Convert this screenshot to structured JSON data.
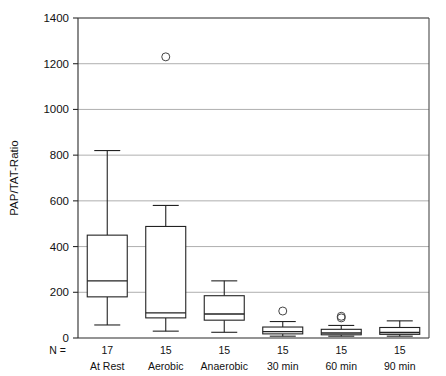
{
  "chart_data": {
    "type": "box",
    "title": "",
    "xlabel": "",
    "ylabel": "PAP/TAT-Ratio",
    "ylim": [
      0,
      1400
    ],
    "ytick_labels": [
      "0",
      "200",
      "400",
      "600",
      "800",
      "1000",
      "1200",
      "1400"
    ],
    "yticks": [
      0,
      200,
      400,
      600,
      800,
      1000,
      1200,
      1400
    ],
    "grid": "horizontal",
    "legend": "none",
    "n_row_prefix": "N =",
    "categories": [
      "At Rest",
      "Aerobic",
      "Anaerobic",
      "30 min",
      "60 min",
      "90 min"
    ],
    "counts": [
      "17",
      "15",
      "15",
      "15",
      "15",
      "15"
    ],
    "boxes": [
      {
        "category": "At Rest",
        "n": 17,
        "whisker_low": 57,
        "q1": 180,
        "median": 250,
        "q3": 450,
        "whisker_high": 820,
        "outliers": []
      },
      {
        "category": "Aerobic",
        "n": 15,
        "whisker_low": 30,
        "q1": 88,
        "median": 110,
        "q3": 488,
        "whisker_high": 580,
        "outliers": [
          1230
        ]
      },
      {
        "category": "Anaerobic",
        "n": 15,
        "whisker_low": 25,
        "q1": 78,
        "median": 105,
        "q3": 185,
        "whisker_high": 250,
        "outliers": []
      },
      {
        "category": "30 min",
        "n": 15,
        "whisker_low": 8,
        "q1": 18,
        "median": 28,
        "q3": 48,
        "whisker_high": 72,
        "outliers": [
          118
        ]
      },
      {
        "category": "60 min",
        "n": 15,
        "whisker_low": 8,
        "q1": 14,
        "median": 22,
        "q3": 38,
        "whisker_high": 55,
        "outliers": [
          95,
          88
        ]
      },
      {
        "category": "90 min",
        "n": 15,
        "whisker_low": 8,
        "q1": 16,
        "median": 24,
        "q3": 46,
        "whisker_high": 75,
        "outliers": []
      }
    ],
    "colors": {
      "box_stroke": "#222222",
      "grid": "#9a9a9a",
      "frame": "#4a4a4a",
      "text": "#111111",
      "background": "#ffffff"
    }
  }
}
